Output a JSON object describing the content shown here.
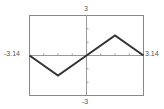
{
  "chart_data": {
    "type": "line",
    "title": "",
    "xlabel": "",
    "ylabel": "",
    "xlim": [
      -3.14,
      3.14
    ],
    "ylim": [
      -3,
      3
    ],
    "grid": false,
    "x_ticks_spacing": 0.785,
    "y_ticks_spacing": 1,
    "tick_labels": {
      "x_min": "-3.14",
      "x_max": "3.14",
      "y_max": "3",
      "y_min": "-3"
    },
    "series": [
      {
        "name": "f(x)",
        "color": "#333333",
        "x": [
          -3.14,
          -1.57,
          0,
          1.57,
          3.14
        ],
        "y": [
          0,
          -1.5,
          0,
          1.5,
          0
        ]
      }
    ]
  },
  "colors": {
    "frame": "#888888",
    "axis": "#999999",
    "curve": "#333333",
    "label": "#555555"
  }
}
